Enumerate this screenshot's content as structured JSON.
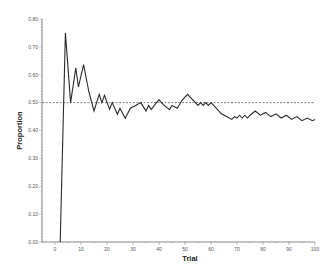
{
  "chart_data": {
    "type": "line",
    "title": "",
    "xlabel": "Trial",
    "ylabel": "Proportion",
    "xlim": [
      -5,
      100
    ],
    "ylim": [
      0.0,
      0.8
    ],
    "x_ticks": [
      0,
      10,
      20,
      30,
      40,
      50,
      60,
      70,
      80,
      90,
      100
    ],
    "y_ticks": [
      0.0,
      0.1,
      0.2,
      0.3,
      0.4,
      0.5,
      0.6,
      0.7,
      0.8
    ],
    "x_tick_labels": [
      "0",
      "10",
      "20",
      "30",
      "40",
      "50",
      "60",
      "70",
      "80",
      "90",
      "100"
    ],
    "y_tick_labels": [
      "0.00",
      "0.10",
      "0.20",
      "0.30",
      "0.40",
      "0.50",
      "0.60",
      "0.70",
      "0.80"
    ],
    "grid": false,
    "legend": null,
    "reference_line": {
      "y": 0.5,
      "style": "dashed"
    },
    "series": [
      {
        "name": "Proportion",
        "x": [
          2,
          4,
          6,
          8,
          9,
          11,
          13,
          15,
          17,
          18,
          19,
          21,
          22,
          24,
          25,
          27,
          29,
          31,
          33,
          35,
          36,
          37,
          39,
          40,
          42,
          44,
          45,
          47,
          49,
          51,
          53,
          55,
          56,
          57,
          58,
          59,
          60,
          62,
          64,
          66,
          68,
          69,
          70,
          71,
          72,
          73,
          74,
          75,
          77,
          79,
          81,
          83,
          85,
          87,
          89,
          91,
          93,
          95,
          97,
          99,
          100
        ],
        "y": [
          0.0,
          0.75,
          0.5,
          0.625,
          0.556,
          0.636,
          0.54,
          0.47,
          0.53,
          0.5,
          0.526,
          0.476,
          0.5,
          0.458,
          0.48,
          0.444,
          0.48,
          0.49,
          0.5,
          0.47,
          0.49,
          0.475,
          0.5,
          0.51,
          0.49,
          0.475,
          0.49,
          0.48,
          0.51,
          0.53,
          0.51,
          0.49,
          0.5,
          0.49,
          0.5,
          0.49,
          0.5,
          0.48,
          0.46,
          0.45,
          0.44,
          0.45,
          0.445,
          0.455,
          0.445,
          0.455,
          0.445,
          0.455,
          0.47,
          0.455,
          0.465,
          0.45,
          0.46,
          0.445,
          0.455,
          0.44,
          0.45,
          0.435,
          0.445,
          0.435,
          0.44
        ]
      }
    ]
  }
}
